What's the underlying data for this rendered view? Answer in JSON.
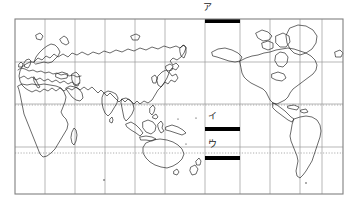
{
  "figure": {
    "kind": "world-map",
    "projection": "Mercator, Pacific-centered",
    "background_color": "#ffffff",
    "border_color": "#808080",
    "coastline_color": "#1a1a1a",
    "graticule_color": "#9a9a9a",
    "tropic_line_color": "#9a9a9a",
    "marker_color": "#000000"
  },
  "frame": {
    "left": 15,
    "top": 19,
    "right": 343,
    "bottom": 194
  },
  "graticule": {
    "meridian_spacing_deg": 30,
    "parallel_spacing_deg": 30,
    "meridian_x": [
      15,
      45,
      75,
      105,
      135,
      165,
      195,
      235,
      265,
      295,
      315,
      343
    ],
    "parallel_y": [
      19,
      62,
      104,
      147,
      194
    ],
    "dotted_parallels_y": [
      105,
      153
    ],
    "dotted_parallel_labels": [
      "Tropic of Cancer",
      "Tropic of Capricorn"
    ]
  },
  "markers": [
    {
      "id": "marker-a",
      "label": "ア",
      "x": 205,
      "y": 19,
      "width": 35,
      "height": 4,
      "label_x": 203,
      "label_y": 3
    },
    {
      "id": "marker-i",
      "label": "イ",
      "x": 205,
      "y": 127,
      "width": 35,
      "height": 4,
      "label_x": 208,
      "label_y": 112
    },
    {
      "id": "marker-u",
      "label": "ウ",
      "x": 205,
      "y": 156,
      "width": 35,
      "height": 4,
      "label_x": 208,
      "label_y": 140
    }
  ],
  "labels": {
    "marker_a": "ア",
    "marker_i": "イ",
    "marker_u": "ウ"
  }
}
